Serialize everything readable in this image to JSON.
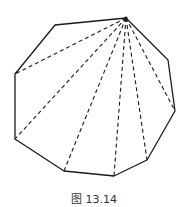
{
  "figure": {
    "caption": "图 13.14",
    "stroke_color": "#1a1a1a",
    "polygon": {
      "sides": 9,
      "vertices": [
        [
          126,
          18
        ],
        [
          168,
          60
        ],
        [
          175,
          111
        ],
        [
          147,
          160
        ],
        [
          114,
          176
        ],
        [
          64,
          171
        ],
        [
          15,
          139
        ],
        [
          15,
          74
        ],
        [
          55,
          25
        ]
      ]
    },
    "diagonals_from_apex": {
      "apex": [
        126,
        18
      ],
      "targets": [
        [
          15,
          74
        ],
        [
          15,
          139
        ],
        [
          64,
          171
        ],
        [
          114,
          176
        ],
        [
          147,
          160
        ],
        [
          175,
          111
        ]
      ],
      "style": "dashed"
    }
  }
}
